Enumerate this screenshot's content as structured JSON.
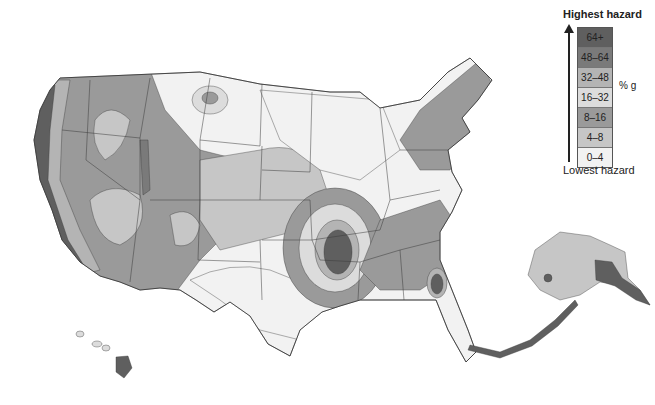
{
  "map": {
    "subject": "Seismic hazard map of the United States",
    "regions_shown": [
      "Contiguous United States",
      "Alaska",
      "Hawaii"
    ],
    "style": "grayscale hazard zones with state boundaries"
  },
  "legend": {
    "top_label": "Highest hazard",
    "bottom_label": "Lowest hazard",
    "unit": "% g",
    "classes": [
      {
        "label": "64+",
        "color": "#5f5f5f"
      },
      {
        "label": "48–64",
        "color": "#7a7a7a"
      },
      {
        "label": "32–48",
        "color": "#b4b4b4"
      },
      {
        "label": "16–32",
        "color": "#dcdcdc"
      },
      {
        "label": "8–16",
        "color": "#9a9a9a"
      },
      {
        "label": "4–8",
        "color": "#c6c6c6"
      },
      {
        "label": "0–4",
        "color": "#f2f2f2"
      }
    ]
  },
  "colors": {
    "boundary": "#3a3a3a",
    "background": "#ffffff"
  }
}
